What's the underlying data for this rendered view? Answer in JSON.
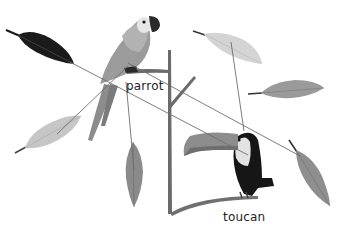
{
  "labels": {
    "parrot": "parrot",
    "toucan": "toucan"
  },
  "birds": [
    {
      "name": "parrot",
      "label": "parrot"
    },
    {
      "name": "toucan",
      "label": "toucan"
    }
  ],
  "feathers": [
    {
      "id": "black-feather",
      "shade": "#1b1b1b",
      "matches": "toucan"
    },
    {
      "id": "light-feather-lower-left",
      "shade": "#c6c6c6",
      "matches": "parrot"
    },
    {
      "id": "gray-feather-bottom-middle",
      "shade": "#8a8a8a",
      "matches": "parrot"
    },
    {
      "id": "light-feather-top-right",
      "shade": "#d4d4d4",
      "matches": "toucan"
    },
    {
      "id": "gray-feather-right-middle",
      "shade": "#9a9a9a",
      "matches": null
    },
    {
      "id": "gray-feather-bottom-right",
      "shade": "#8e8e8e",
      "matches": "parrot"
    }
  ],
  "colors": {
    "line": "#6e6e6e",
    "branch": "#707070",
    "toucan_body": "#161616",
    "toucan_beak": "#8d8d8d",
    "parrot_body": "#9b9b9b"
  }
}
